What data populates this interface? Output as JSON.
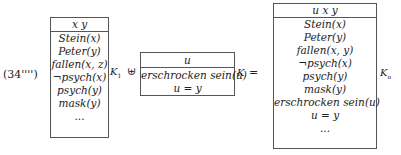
{
  "example_label": "(34'''')",
  "drs1": {
    "universe": "x y",
    "conditions": [
      "Stein(x)",
      "Peter(y)",
      "fallen(x, z)",
      "¬psych(x)",
      "psych(y)",
      "mask(y)",
      "..."
    ],
    "context": "K",
    "context_sub": "1"
  },
  "merge_op": "⊎",
  "drs2": {
    "universe": "u",
    "conditions": [
      "erschrocken sein(u)",
      "u = y"
    ],
    "context": "K"
  },
  "equals": "=",
  "drs3": {
    "universe": "u x y",
    "conditions": [
      "Stein(x)",
      "Peter(y)",
      "fallen(x, y)",
      "¬psych(x)",
      "psych(y)",
      "mask(y)",
      "erschrocken sein(u)",
      "u = y",
      "..."
    ],
    "context": "K",
    "context_sub": "o"
  }
}
